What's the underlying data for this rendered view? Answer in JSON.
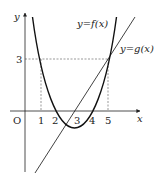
{
  "axes": {
    "x_label": "x",
    "y_label": "y",
    "origin_label": "O",
    "x_ticks": [
      "1",
      "2",
      "3",
      "4",
      "5"
    ],
    "y_ticks": [
      "3"
    ]
  },
  "curves": {
    "f_label": "y=f(x)",
    "g_label": "y=g(x)"
  },
  "colors": {
    "curve": "#111111",
    "axis": "#222222",
    "guide": "#555555"
  }
}
